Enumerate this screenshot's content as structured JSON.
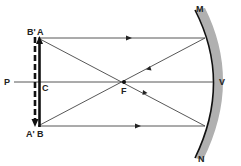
{
  "diagram": {
    "type": "concave-mirror-ray-diagram",
    "labels": {
      "A": "A",
      "B_prime": "B'",
      "B": "B",
      "A_prime": "A'",
      "C": "C",
      "P": "P",
      "F": "F",
      "V": "V",
      "M": "M",
      "N": "N"
    },
    "points": {
      "A": [
        38,
        38
      ],
      "B": [
        38,
        126
      ],
      "C": [
        38,
        82
      ],
      "P": [
        14,
        82
      ],
      "F": [
        124,
        82
      ],
      "V": [
        210,
        82
      ],
      "M": [
        200,
        12
      ],
      "N": [
        205,
        155
      ],
      "mirror_top_hit": [
        204,
        38
      ],
      "mirror_bottom_hit": [
        204,
        126
      ]
    },
    "colors": {
      "line": "#333333",
      "object": "#111111",
      "mirror_back": "#a8a8a8",
      "background": "#ffffff"
    }
  }
}
